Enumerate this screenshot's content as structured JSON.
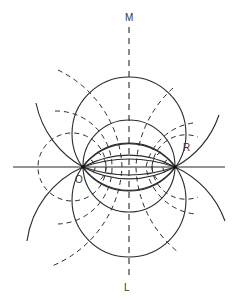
{
  "diagram": {
    "labels": {
      "top": "M",
      "bottom": "L",
      "left_point": "O",
      "right_point": "R"
    },
    "colors": {
      "stroke": "#2a2a2a",
      "background": "#ffffff"
    },
    "points": {
      "O": [
        83,
        167
      ],
      "R": [
        175,
        167
      ]
    },
    "axis_line": {
      "x1": 13,
      "y1": 167,
      "x2": 225,
      "y2": 167
    },
    "bisector_line": {
      "x": 129,
      "y1": 27,
      "y2": 279,
      "dash": "6 5"
    },
    "solid_circles": [
      {
        "name": "circle-a-upper",
        "cx": 129,
        "cy": 134,
        "r": 57
      },
      {
        "name": "circle-a-lower",
        "cx": 129,
        "cy": 200,
        "r": 57
      },
      {
        "name": "circle-diameter-or",
        "cx": 129,
        "cy": 166,
        "r": 46
      },
      {
        "name": "circle-c-upper-cap",
        "cx": 129,
        "cy": 200,
        "r": 57,
        "cap_only": true
      }
    ],
    "solid_arcs": [
      {
        "name": "arc-cap-upper-1",
        "d": "M83,167 A57,57 0 0 1 175,167"
      },
      {
        "name": "arc-cap-lower-1",
        "d": "M83,167 A57,57 0 0 0 175,167"
      },
      {
        "name": "arc-outer-upper",
        "d": "M36,103 A95,95 0 0 0 83,167 A95,95 0 0 0 175,167 A95,95 0 0 0 219,115"
      },
      {
        "name": "arc-outer-lower",
        "d": "M27,241 A95,95 0 0 1 83,167 A95,95 0 0 1 175,167 A95,95 0 0 1 225,221"
      },
      {
        "name": "arc-flat-upper",
        "d": "M83,167 A140,140 0 0 1 175,167"
      },
      {
        "name": "arc-flat-lower",
        "d": "M83,167 A140,140 0 0 0 175,167"
      }
    ],
    "dashed_arcs": [
      {
        "name": "dashed-left-large",
        "d": "M58,70 A113,113 0 0 1 122,167 A113,113 0 0 1 52,266"
      },
      {
        "name": "dashed-left-medium",
        "d": "M55,111 A56,56 0 0 1 112,167 A56,56 0 0 1 58,224"
      },
      {
        "name": "dashed-left-small",
        "d": "M106,167 A34,34 0 1 1 106,166.9"
      },
      {
        "name": "dashed-left-tiny",
        "d": "M97,152 A17,17 0 0 1 97,182"
      },
      {
        "name": "dashed-left-micro",
        "d": "M91,160 A8,8 0 0 1 91,174"
      },
      {
        "name": "dashed-right-large",
        "d": "M173,88 A113,113 0 0 0 136,167 A113,113 0 0 0 178,252"
      },
      {
        "name": "dashed-right-medium",
        "d": "M193,123 A56,56 0 0 0 146,167 A56,56 0 0 0 195,214"
      },
      {
        "name": "dashed-right-small",
        "d": "M152,167 A34,34 0 0 1 198,137"
      },
      {
        "name": "dashed-right-small-lower",
        "d": "M152,167 A34,34 0 0 0 198,197"
      },
      {
        "name": "dashed-right-tiny",
        "d": "M161,152 A17,17 0 0 0 161,182"
      },
      {
        "name": "dashed-right-micro",
        "d": "M167,160 A8,8 0 0 0 167,174"
      }
    ],
    "label_positions": {
      "top": [
        125,
        13
      ],
      "bottom": [
        124,
        283
      ],
      "left_point": [
        75,
        175
      ],
      "right_point": [
        183,
        143
      ]
    }
  }
}
